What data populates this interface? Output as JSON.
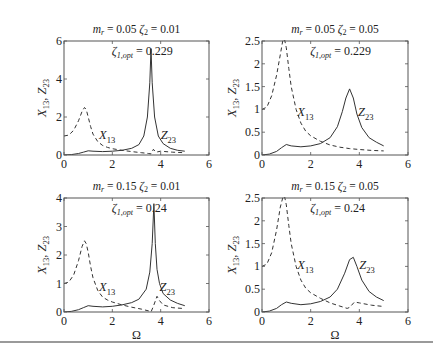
{
  "figure": {
    "xlabel": "Ω",
    "ylabel_main": "X",
    "ylabel_sub1": "13",
    "ylabel_sep": ", ",
    "ylabel_main2": "Z",
    "ylabel_sub2": "23"
  },
  "chart_data": [
    {
      "type": "line",
      "title": "m_r = 0.05 ζ_2 = 0.01",
      "title_parts": {
        "m": "m",
        "r": "r",
        "eq1": " = 0.05 ",
        "z": "ζ",
        "zsub": "2",
        "eq2": " = 0.01"
      },
      "annotation": {
        "z": "ζ",
        "sub": "1,opt",
        "val": " = 0.229"
      },
      "xlabel": "",
      "ylabel": "X13, Z23",
      "xlim": [
        0,
        6
      ],
      "ylim": [
        0,
        6
      ],
      "xticks": [
        0,
        2,
        4,
        6
      ],
      "yticks": [
        0,
        2,
        4,
        6
      ],
      "grid": false,
      "box": {
        "x0": 64,
        "x1": 209,
        "y0": 41,
        "y1": 155
      },
      "labels": {
        "x13": {
          "x": 1.45,
          "y": 0.85
        },
        "z23": {
          "x": 4.0,
          "y": 0.85
        }
      },
      "series": [
        {
          "name": "X13",
          "style": "dashed",
          "x": [
            0,
            0.2,
            0.4,
            0.6,
            0.75,
            0.85,
            0.92,
            1.0,
            1.1,
            1.2,
            1.4,
            1.6,
            1.8,
            2.0,
            2.4,
            2.8,
            3.2,
            3.5,
            3.6,
            3.7,
            3.8,
            4.0,
            4.5,
            5.0
          ],
          "y": [
            1.0,
            1.05,
            1.3,
            1.8,
            2.3,
            2.5,
            2.4,
            2.0,
            1.5,
            1.1,
            0.7,
            0.5,
            0.4,
            0.33,
            0.25,
            0.18,
            0.12,
            0.08,
            0.06,
            0.3,
            0.15,
            0.2,
            0.15,
            0.12
          ]
        },
        {
          "name": "Z23",
          "style": "solid",
          "x": [
            0,
            0.3,
            0.6,
            0.8,
            1.0,
            1.2,
            1.6,
            2.0,
            2.4,
            2.8,
            3.1,
            3.3,
            3.45,
            3.55,
            3.6,
            3.65,
            3.75,
            3.9,
            4.1,
            4.4,
            4.7,
            5.0
          ],
          "y": [
            0,
            0.02,
            0.08,
            0.15,
            0.22,
            0.2,
            0.18,
            0.2,
            0.25,
            0.35,
            0.55,
            1.0,
            2.0,
            3.8,
            5.6,
            3.8,
            2.0,
            1.0,
            0.6,
            0.35,
            0.25,
            0.2
          ]
        }
      ]
    },
    {
      "type": "line",
      "title": "m_r = 0.05 ζ_2 = 0.05",
      "title_parts": {
        "m": "m",
        "r": "r",
        "eq1": " = 0.05 ",
        "z": "ζ",
        "zsub": "2",
        "eq2": " = 0.05"
      },
      "annotation": {
        "z": "ζ",
        "sub": "1,opt",
        "val": " = 0.229"
      },
      "xlabel": "",
      "ylabel": "X13, Z23",
      "xlim": [
        0,
        6
      ],
      "ylim": [
        0,
        2.5
      ],
      "xticks": [
        0,
        2,
        4,
        6
      ],
      "yticks": [
        0,
        0.5,
        1,
        1.5,
        2,
        2.5
      ],
      "grid": false,
      "box": {
        "x0": 262,
        "x1": 408,
        "y0": 41,
        "y1": 155
      },
      "labels": {
        "x13": {
          "x": 1.45,
          "y": 0.85
        },
        "z23": {
          "x": 3.95,
          "y": 0.85
        }
      },
      "series": [
        {
          "name": "X13",
          "style": "dashed",
          "x": [
            0,
            0.2,
            0.4,
            0.6,
            0.75,
            0.85,
            0.92,
            1.0,
            1.1,
            1.2,
            1.4,
            1.6,
            1.8,
            2.0,
            2.4,
            2.8,
            3.2,
            3.6,
            4.0,
            4.5,
            5.0
          ],
          "y": [
            1.0,
            1.05,
            1.3,
            1.75,
            2.2,
            2.5,
            2.55,
            2.35,
            1.9,
            1.5,
            1.0,
            0.7,
            0.52,
            0.42,
            0.3,
            0.22,
            0.17,
            0.14,
            0.12,
            0.1,
            0.09
          ]
        },
        {
          "name": "Z23",
          "style": "solid",
          "x": [
            0,
            0.3,
            0.6,
            0.8,
            1.0,
            1.2,
            1.6,
            2.0,
            2.4,
            2.8,
            3.1,
            3.3,
            3.45,
            3.6,
            3.75,
            3.9,
            4.1,
            4.4,
            4.7,
            5.0
          ],
          "y": [
            0,
            0.02,
            0.08,
            0.16,
            0.23,
            0.2,
            0.18,
            0.2,
            0.25,
            0.38,
            0.62,
            0.95,
            1.25,
            1.45,
            1.25,
            0.9,
            0.6,
            0.38,
            0.28,
            0.2
          ]
        }
      ]
    },
    {
      "type": "line",
      "title": "m_r = 0.15 ζ_2 = 0.01",
      "title_parts": {
        "m": "m",
        "r": "r",
        "eq1": " = 0.15 ",
        "z": "ζ",
        "zsub": "2",
        "eq2": " = 0.01"
      },
      "annotation": {
        "z": "ζ",
        "sub": "1,opt",
        "val": " = 0.24"
      },
      "xlabel": "Ω",
      "ylabel": "X13, Z23",
      "xlim": [
        0,
        6
      ],
      "ylim": [
        0,
        4
      ],
      "xticks": [
        0,
        2,
        4,
        6
      ],
      "yticks": [
        0,
        1,
        2,
        3,
        4
      ],
      "grid": false,
      "box": {
        "x0": 64,
        "x1": 209,
        "y0": 198,
        "y1": 312
      },
      "labels": {
        "x13": {
          "x": 1.45,
          "y": 0.72
        },
        "z23": {
          "x": 3.95,
          "y": 0.72
        }
      },
      "series": [
        {
          "name": "X13",
          "style": "dashed",
          "x": [
            0,
            0.2,
            0.4,
            0.6,
            0.75,
            0.85,
            0.92,
            1.0,
            1.1,
            1.2,
            1.4,
            1.6,
            1.8,
            2.0,
            2.4,
            2.8,
            3.2,
            3.5,
            3.6,
            3.7,
            3.85,
            3.95,
            4.1,
            4.5,
            5.0
          ],
          "y": [
            1.0,
            1.05,
            1.3,
            1.8,
            2.3,
            2.5,
            2.4,
            2.1,
            1.6,
            1.2,
            0.75,
            0.52,
            0.42,
            0.35,
            0.25,
            0.17,
            0.1,
            0.04,
            0.0,
            0.2,
            0.55,
            0.4,
            0.25,
            0.15,
            0.12
          ]
        },
        {
          "name": "Z23",
          "style": "solid",
          "x": [
            0,
            0.3,
            0.6,
            0.8,
            1.0,
            1.2,
            1.6,
            2.0,
            2.4,
            2.8,
            3.1,
            3.4,
            3.55,
            3.65,
            3.72,
            3.78,
            3.85,
            3.95,
            4.1,
            4.4,
            4.7,
            5.0
          ],
          "y": [
            0,
            0.02,
            0.08,
            0.15,
            0.22,
            0.2,
            0.18,
            0.2,
            0.25,
            0.33,
            0.45,
            0.8,
            1.4,
            2.4,
            3.8,
            2.4,
            1.5,
            1.0,
            0.65,
            0.42,
            0.3,
            0.22
          ]
        }
      ]
    },
    {
      "type": "line",
      "title": "m_r = 0.15 ζ_2 = 0.05",
      "title_parts": {
        "m": "m",
        "r": "r",
        "eq1": " = 0.15 ",
        "z": "ζ",
        "zsub": "2",
        "eq2": " = 0.05"
      },
      "annotation": {
        "z": "ζ",
        "sub": "1,opt",
        "val": " = 0.24"
      },
      "xlabel": "Ω",
      "ylabel": "X13, Z23",
      "xlim": [
        0,
        6
      ],
      "ylim": [
        0,
        2.5
      ],
      "xticks": [
        0,
        2,
        4,
        6
      ],
      "yticks": [
        0,
        0.5,
        1,
        1.5,
        2,
        2.5
      ],
      "grid": false,
      "box": {
        "x0": 262,
        "x1": 408,
        "y0": 198,
        "y1": 312
      },
      "labels": {
        "x13": {
          "x": 1.45,
          "y": 0.95
        },
        "z23": {
          "x": 4.0,
          "y": 0.95
        }
      },
      "series": [
        {
          "name": "X13",
          "style": "dashed",
          "x": [
            0,
            0.2,
            0.4,
            0.6,
            0.75,
            0.85,
            0.92,
            1.0,
            1.1,
            1.2,
            1.4,
            1.6,
            1.8,
            2.0,
            2.4,
            2.8,
            3.2,
            3.5,
            3.6,
            3.8,
            4.0,
            4.5,
            5.0
          ],
          "y": [
            1.0,
            1.05,
            1.3,
            1.8,
            2.3,
            2.5,
            2.55,
            2.35,
            1.9,
            1.5,
            1.0,
            0.7,
            0.52,
            0.42,
            0.3,
            0.2,
            0.13,
            0.08,
            0.1,
            0.22,
            0.2,
            0.15,
            0.12
          ]
        },
        {
          "name": "Z23",
          "style": "solid",
          "x": [
            0,
            0.3,
            0.6,
            0.8,
            1.0,
            1.2,
            1.6,
            2.0,
            2.4,
            2.8,
            3.1,
            3.4,
            3.6,
            3.75,
            3.9,
            4.1,
            4.4,
            4.7,
            5.0
          ],
          "y": [
            0,
            0.02,
            0.08,
            0.16,
            0.22,
            0.19,
            0.16,
            0.18,
            0.23,
            0.33,
            0.5,
            0.85,
            1.15,
            1.2,
            1.0,
            0.7,
            0.45,
            0.33,
            0.25
          ]
        }
      ]
    }
  ]
}
